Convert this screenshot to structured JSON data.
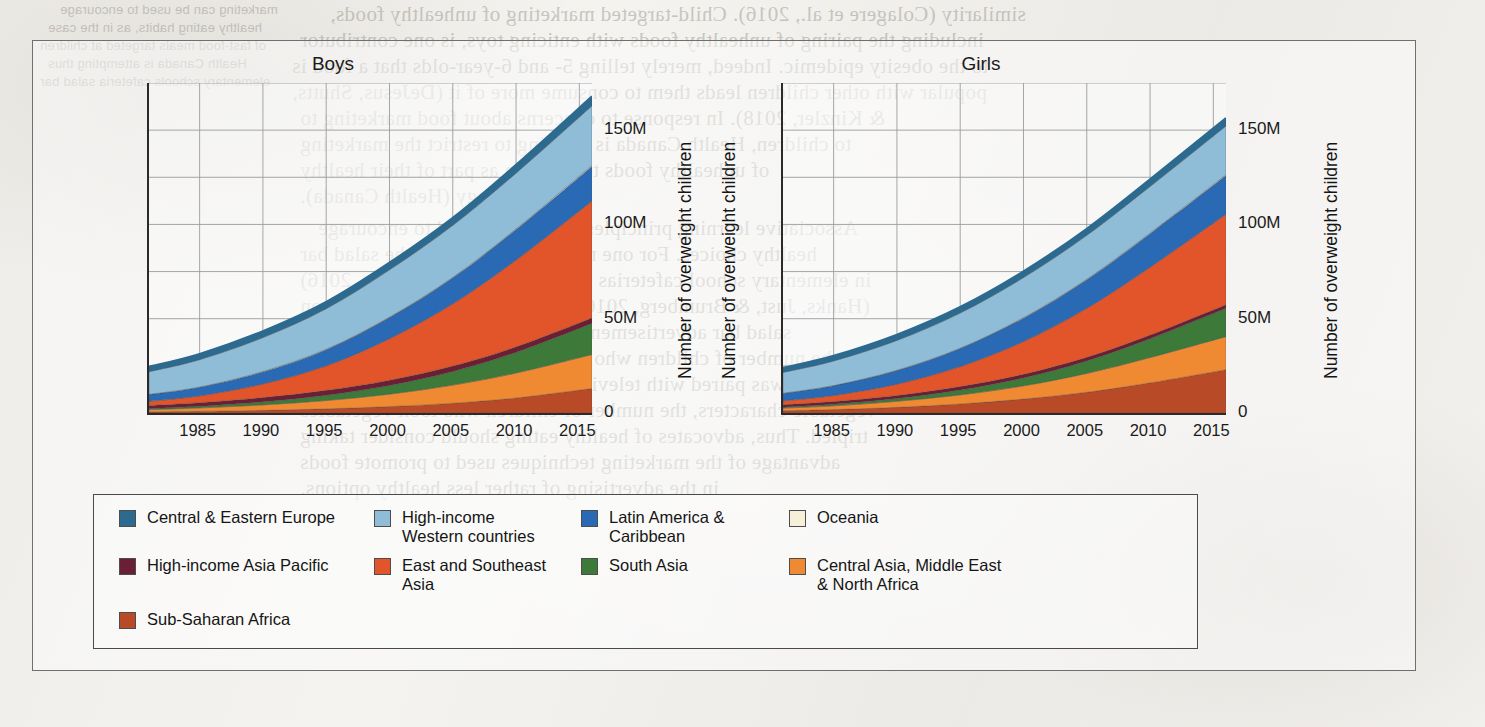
{
  "figure": {
    "panels": [
      {
        "id": "boys",
        "title": "Boys",
        "y_axis_title": "Number of overweight children"
      },
      {
        "id": "girls",
        "title": "Girls",
        "y_axis_title": "Number of overweight children"
      }
    ]
  },
  "legend": {
    "items": [
      {
        "label": "Central & Eastern Europe",
        "color": "#2c6a8f"
      },
      {
        "label": "High-income\nWestern countries",
        "color": "#8fbcd6"
      },
      {
        "label": "Latin America &\nCaribbean",
        "color": "#2a6ab5"
      },
      {
        "label": "Oceania",
        "color": "#f6f0d9"
      },
      {
        "label": "High-income Asia Pacific",
        "color": "#6b1f35"
      },
      {
        "label": "East and Southeast\nAsia",
        "color": "#e2552a"
      },
      {
        "label": "South Asia",
        "color": "#3d7a3a"
      },
      {
        "label": "Central Asia, Middle East\n& North Africa",
        "color": "#ef8a33"
      },
      {
        "label": "Sub-Saharan Africa",
        "color": "#b94a28"
      }
    ]
  },
  "bleed_text": [
    {
      "text": "similarity (Colagere et al., 2016). Child-targeted marketing of unhealthy foods,",
      "x": 330,
      "y": 2,
      "cls": "big"
    },
    {
      "text": "including the pairing of unhealthy foods with enticing toys, is one contributor",
      "x": 300,
      "y": 28,
      "cls": "big"
    },
    {
      "text": "to the obesity epidemic. Indeed, merely telling 5- and 6-year-olds that a food is",
      "x": 292,
      "y": 54,
      "cls": "big"
    },
    {
      "text": "popular with other children leads them to consume more of it (DeJesus, Shutts,",
      "x": 292,
      "y": 80,
      "cls": "big"
    },
    {
      "text": "& Kinzler, 2018). In response to concerns about food marketing to",
      "x": 300,
      "y": 106,
      "cls": "big"
    },
    {
      "text": "to children, Health Canada is working to restrict the marketing",
      "x": 300,
      "y": 132,
      "cls": "big"
    },
    {
      "text": "of unhealthy foods to children as part of their healthy",
      "x": 300,
      "y": 158,
      "cls": "big"
    },
    {
      "text": "eating strategy (Health Canada).",
      "x": 300,
      "y": 184,
      "cls": "big"
    },
    {
      "text": "Associative learning principles can also be used to encourage",
      "x": 318,
      "y": 216,
      "cls": "big"
    },
    {
      "text": "healthy choices. For one month, a poster near the salad bar",
      "x": 300,
      "y": 242,
      "cls": "big"
    },
    {
      "text": "in elementary school cafeterias (Hanks, Just, & Brumberg, 2016)",
      "x": 300,
      "y": 268,
      "cls": "big"
    },
    {
      "text": "(Hanks, Just, & Brumberg, 2016) featured two vegetable cartoon",
      "x": 300,
      "y": 294,
      "cls": "big"
    },
    {
      "text": "salad bar advertisements featuring vegetable characters,",
      "x": 300,
      "y": 320,
      "cls": "big"
    },
    {
      "text": "the number of children who took vegetables increased. When",
      "x": 300,
      "y": 346,
      "cls": "big"
    },
    {
      "text": "the banner was paired with television advertisements featuring the",
      "x": 300,
      "y": 372,
      "cls": "big"
    },
    {
      "text": "vegetable characters, the number of children who took vegetables",
      "x": 300,
      "y": 398,
      "cls": "big"
    },
    {
      "text": "tripled. Thus, advocates of healthy eating should consider taking",
      "x": 300,
      "y": 424,
      "cls": "big"
    },
    {
      "text": "advantage of the marketing techniques used to promote foods",
      "x": 300,
      "y": 450,
      "cls": "big"
    },
    {
      "text": "in the advertising of rather less healthy options.",
      "x": 300,
      "y": 476,
      "cls": "big"
    },
    {
      "text": "marketing can be used to encourage",
      "x": 60,
      "y": 2,
      "cls": "small"
    },
    {
      "text": "healthy eating habits, as in the case",
      "x": 48,
      "y": 20,
      "cls": "small"
    },
    {
      "text": "of fast-food meals targeted at children",
      "x": 40,
      "y": 38,
      "cls": "small"
    },
    {
      "text": "Health Canada is attempting thus",
      "x": 48,
      "y": 56,
      "cls": "small"
    },
    {
      "text": "elementary schools cafeteria salad bar",
      "x": 40,
      "y": 74,
      "cls": "small"
    }
  ],
  "chart_data": [
    {
      "type": "area",
      "stacked": true,
      "title": "Boys",
      "xlabel": "",
      "ylabel": "Number of overweight children",
      "xlim": [
        1981,
        2016
      ],
      "ylim": [
        0,
        175
      ],
      "y_unit": "millions",
      "grid": true,
      "yticks": [
        0,
        50,
        100,
        150
      ],
      "ytick_labels": [
        "0",
        "50M",
        "100M",
        "150M"
      ],
      "y_gridlines": [
        25,
        50,
        75,
        100,
        125,
        150,
        175
      ],
      "x": [
        1981,
        1985,
        1990,
        1995,
        2000,
        2005,
        2010,
        2016
      ],
      "xticks": [
        1985,
        1990,
        1995,
        2000,
        2005,
        2010,
        2015
      ],
      "xtick_labels": [
        "1985",
        "1990",
        "1995",
        "2000",
        "2005",
        "2010",
        "2015"
      ],
      "series": [
        {
          "name": "Sub-Saharan Africa",
          "color": "#b94a28",
          "values": [
            0.6,
            0.9,
            1.4,
            2.2,
            3.4,
            5.2,
            8.0,
            13.0
          ]
        },
        {
          "name": "Central Asia, Middle East & North Africa",
          "color": "#ef8a33",
          "values": [
            1.2,
            1.8,
            2.9,
            4.4,
            6.6,
            9.6,
            13.2,
            18.0
          ]
        },
        {
          "name": "South Asia",
          "color": "#3d7a3a",
          "values": [
            0.6,
            0.9,
            1.6,
            2.8,
            4.6,
            7.2,
            11.0,
            16.5
          ]
        },
        {
          "name": "High-income Asia Pacific",
          "color": "#6b1f35",
          "values": [
            1.6,
            1.9,
            2.3,
            2.6,
            2.8,
            2.9,
            2.9,
            2.9
          ]
        },
        {
          "name": "East and Southeast Asia",
          "color": "#e2552a",
          "values": [
            2.2,
            3.6,
            7.2,
            13.0,
            22.0,
            33.0,
            46.0,
            62.0
          ]
        },
        {
          "name": "Latin America & Caribbean",
          "color": "#2a6ab5",
          "values": [
            3.6,
            4.6,
            6.4,
            8.6,
            11.2,
            13.8,
            16.2,
            18.5
          ]
        },
        {
          "name": "Oceania",
          "color": "#f6f0d9",
          "values": [
            0.1,
            0.1,
            0.2,
            0.2,
            0.3,
            0.3,
            0.4,
            0.5
          ]
        },
        {
          "name": "High-income Western countries",
          "color": "#8fbcd6",
          "values": [
            12.0,
            14.5,
            18.0,
            21.5,
            25.0,
            27.5,
            29.5,
            31.5
          ]
        },
        {
          "name": "Central & Eastern Europe",
          "color": "#2c6a8f",
          "values": [
            2.6,
            3.0,
            3.4,
            3.6,
            3.8,
            4.0,
            4.4,
            5.0
          ]
        }
      ],
      "totals": [
        24.5,
        31.3,
        43.4,
        58.9,
        79.7,
        103.5,
        131.6,
        167.9
      ]
    },
    {
      "type": "area",
      "stacked": true,
      "title": "Girls",
      "xlabel": "",
      "ylabel": "Number of overweight children",
      "xlim": [
        1981,
        2016
      ],
      "ylim": [
        0,
        175
      ],
      "y_unit": "millions",
      "grid": true,
      "yticks": [
        0,
        50,
        100,
        150
      ],
      "ytick_labels": [
        "0",
        "50M",
        "100M",
        "150M"
      ],
      "y_gridlines": [
        25,
        50,
        75,
        100,
        125,
        150,
        175
      ],
      "x": [
        1981,
        1985,
        1990,
        1995,
        2000,
        2005,
        2010,
        2016
      ],
      "xticks": [
        1985,
        1990,
        1995,
        2000,
        2005,
        2010,
        2015
      ],
      "xtick_labels": [
        "1985",
        "1990",
        "1995",
        "2000",
        "2005",
        "2010",
        "2015"
      ],
      "series": [
        {
          "name": "Sub-Saharan Africa",
          "color": "#b94a28",
          "values": [
            1.2,
            1.8,
            3.0,
            4.8,
            7.4,
            11.0,
            16.0,
            23.0
          ]
        },
        {
          "name": "Central Asia, Middle East & North Africa",
          "color": "#ef8a33",
          "values": [
            1.4,
            2.0,
            3.2,
            4.8,
            7.0,
            10.0,
            13.4,
            17.5
          ]
        },
        {
          "name": "South Asia",
          "color": "#3d7a3a",
          "values": [
            0.6,
            0.9,
            1.5,
            2.6,
            4.2,
            6.6,
            10.0,
            15.0
          ]
        },
        {
          "name": "High-income Asia Pacific",
          "color": "#6b1f35",
          "values": [
            1.2,
            1.4,
            1.6,
            1.8,
            1.9,
            1.9,
            1.9,
            1.9
          ]
        },
        {
          "name": "East and Southeast Asia",
          "color": "#e2552a",
          "values": [
            2.0,
            3.2,
            6.0,
            10.6,
            17.4,
            26.0,
            36.0,
            48.0
          ]
        },
        {
          "name": "Latin America & Caribbean",
          "color": "#2a6ab5",
          "values": [
            4.0,
            5.2,
            7.2,
            9.6,
            12.4,
            15.2,
            17.8,
            20.5
          ]
        },
        {
          "name": "Oceania",
          "color": "#f6f0d9",
          "values": [
            0.1,
            0.1,
            0.2,
            0.2,
            0.3,
            0.3,
            0.4,
            0.5
          ]
        },
        {
          "name": "High-income Western countries",
          "color": "#8fbcd6",
          "values": [
            11.0,
            13.0,
            15.8,
            18.6,
            21.2,
            23.2,
            24.6,
            25.8
          ]
        },
        {
          "name": "Central & Eastern Europe",
          "color": "#2c6a8f",
          "values": [
            2.4,
            2.7,
            3.0,
            3.2,
            3.3,
            3.5,
            3.8,
            4.2
          ]
        }
      ],
      "totals": [
        23.9,
        30.3,
        41.5,
        56.2,
        75.1,
        97.7,
        123.9,
        156.4
      ]
    }
  ]
}
